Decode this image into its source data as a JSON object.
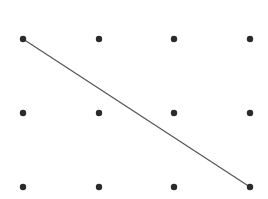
{
  "diagram": {
    "type": "dot-grid",
    "rows": 3,
    "cols": 4,
    "dot_color": "#2b2b2b",
    "line_color": "#555555",
    "dot_radius": 3.2,
    "col_x": [
      23,
      99,
      174,
      250
    ],
    "row_y": [
      39,
      113,
      187
    ],
    "line": {
      "from": [
        0,
        0
      ],
      "to": [
        2,
        3
      ]
    }
  }
}
